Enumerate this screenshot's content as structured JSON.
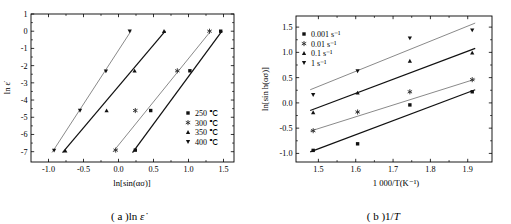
{
  "figure": {
    "panels": [
      {
        "id": "a",
        "caption_prefix": "( a )",
        "caption_body": "ln ",
        "caption_symbol": "ε̇"
      },
      {
        "id": "b",
        "caption_prefix": "( b )",
        "caption_body": "1/",
        "caption_symbol": "T"
      }
    ]
  },
  "chart_data": [
    {
      "type": "scatter",
      "panel": "a",
      "title": "",
      "xlabel": "ln[sin(ασ)]",
      "ylabel": "ln ε̇",
      "xlim": [
        -1.25,
        1.65
      ],
      "ylim": [
        -7.6,
        1.0
      ],
      "xticks": [
        -1.0,
        -0.5,
        0.0,
        0.5,
        1.0,
        1.5
      ],
      "xticklabels": [
        "-1.0",
        "-0.5",
        "0.0",
        "0.5",
        "1.0",
        "1.5"
      ],
      "yticks": [
        1,
        0,
        -1,
        -2,
        -3,
        -4,
        -5,
        -6,
        -7
      ],
      "yticklabels": [
        "1",
        "0",
        "-1",
        "-2",
        "-3",
        "-4",
        "-5",
        "-6",
        "-7"
      ],
      "grid": false,
      "legend_position": "lower-right",
      "series": [
        {
          "name": "250 ℃",
          "marker": "square",
          "x": [
            0.24,
            0.46,
            1.02,
            1.46
          ],
          "y": [
            -6.91,
            -4.61,
            -2.3,
            0.0
          ],
          "fit_x": [
            0.2,
            1.48
          ],
          "fit_y": [
            -7.05,
            0.02
          ]
        },
        {
          "name": "300 ℃",
          "marker": "star",
          "x": [
            -0.04,
            0.24,
            0.84,
            1.3
          ],
          "y": [
            -6.91,
            -4.61,
            -2.3,
            0.0
          ],
          "fit_x": [
            -0.08,
            1.32
          ],
          "fit_y": [
            -7.02,
            0.02
          ]
        },
        {
          "name": "350 ℃",
          "marker": "triangle-up",
          "x": [
            -0.76,
            -0.17,
            0.23,
            0.65
          ],
          "y": [
            -6.95,
            -4.61,
            -2.3,
            0.0
          ],
          "fit_x": [
            -0.8,
            0.67
          ],
          "fit_y": [
            -7.05,
            0.02
          ]
        },
        {
          "name": "400 ℃",
          "marker": "triangle-down",
          "x": [
            -0.92,
            -0.55,
            -0.18,
            0.16
          ],
          "y": [
            -6.93,
            -4.61,
            -2.32,
            0.0
          ],
          "fit_x": [
            -0.95,
            0.18
          ],
          "fit_y": [
            -7.05,
            0.02
          ]
        }
      ]
    },
    {
      "type": "scatter",
      "panel": "b",
      "title": "",
      "xlabel": "1 000/T(K⁻¹)",
      "ylabel": "ln[sin h(ασ)]",
      "xlim": [
        1.44,
        1.965
      ],
      "ylim": [
        -1.17,
        1.72
      ],
      "xticks": [
        1.5,
        1.6,
        1.7,
        1.8,
        1.9
      ],
      "xticklabels": [
        "1.5",
        "1.6",
        "1.7",
        "1.8",
        "1.9"
      ],
      "yticks": [
        1.5,
        1.0,
        0.5,
        0.0,
        -0.5,
        -1.0
      ],
      "yticklabels": [
        "1.5",
        "1.0",
        "0.5",
        "0.0",
        "-0.5",
        "-1.0"
      ],
      "grid": false,
      "legend_position": "upper-left",
      "series": [
        {
          "name": "0.001 s⁻¹",
          "marker": "square",
          "x": [
            1.486,
            1.605,
            1.745,
            1.912
          ],
          "y": [
            -0.94,
            -0.81,
            -0.04,
            0.22
          ],
          "fit_x": [
            1.478,
            1.92
          ],
          "fit_y": [
            -0.97,
            0.26
          ]
        },
        {
          "name": "0.01 s⁻¹",
          "marker": "star",
          "x": [
            1.486,
            1.605,
            1.745,
            1.912
          ],
          "y": [
            -0.55,
            -0.18,
            0.22,
            0.46
          ],
          "fit_x": [
            1.478,
            1.92
          ],
          "fit_y": [
            -0.56,
            0.47
          ]
        },
        {
          "name": "0.1 s⁻¹",
          "marker": "triangle-up",
          "x": [
            1.486,
            1.605,
            1.745,
            1.912
          ],
          "y": [
            -0.19,
            0.2,
            0.83,
            0.99
          ],
          "fit_x": [
            1.478,
            1.92
          ],
          "fit_y": [
            -0.15,
            1.08
          ]
        },
        {
          "name": "1 s⁻¹",
          "marker": "triangle-down",
          "x": [
            1.486,
            1.605,
            1.745,
            1.912
          ],
          "y": [
            0.16,
            0.63,
            1.28,
            1.44
          ],
          "fit_x": [
            1.478,
            1.92
          ],
          "fit_y": [
            0.26,
            1.58
          ]
        }
      ]
    }
  ]
}
